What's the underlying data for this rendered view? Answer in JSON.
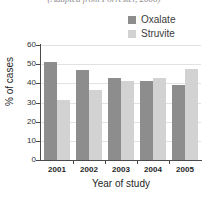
{
  "caption": "(Adapted from Forrester, 2006)",
  "legend": {
    "position": "top-right",
    "entries": [
      {
        "label": "Oxalate",
        "color": "#8d8d8d"
      },
      {
        "label": "Struvite",
        "color": "#d2d2d2"
      }
    ]
  },
  "axes": {
    "ylabel": "% of cases",
    "xlabel": "Year of study",
    "yticks": [
      "0",
      "10",
      "20",
      "30",
      "40",
      "50",
      "60"
    ]
  },
  "chart_data": {
    "type": "bar",
    "title": "",
    "subtitle": "(Adapted from Forrester, 2006)",
    "xlabel": "Year of study",
    "ylabel": "% of cases",
    "categories": [
      "2001",
      "2002",
      "2003",
      "2004",
      "2005"
    ],
    "series": [
      {
        "name": "Oxalate",
        "color": "#8d8d8d",
        "values": [
          51,
          47,
          43,
          41,
          39
        ]
      },
      {
        "name": "Struvite",
        "color": "#d2d2d2",
        "values": [
          31.5,
          36.5,
          41,
          43,
          47.5
        ]
      }
    ],
    "ylim": [
      0,
      60
    ],
    "ytick_step": 10,
    "grid": "horizontal",
    "legend_position": "top-right"
  }
}
